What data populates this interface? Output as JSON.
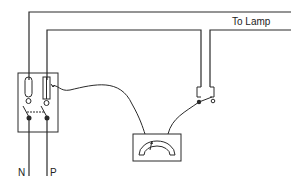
{
  "diagram": {
    "type": "wiring-circuit",
    "labels": {
      "to_lamp": "To  Lamp",
      "neutral": "N",
      "phase": "P"
    },
    "components": [
      {
        "id": "fuse-box",
        "description": "double-pole switch fuse unit with fuse and link"
      },
      {
        "id": "lamp-switch",
        "description": "single-pole switch on lamp circuit"
      },
      {
        "id": "meter",
        "description": "analog meter connected between fuse and switch"
      }
    ],
    "colors": {
      "line": "#2a2a2a",
      "background": "#ffffff"
    }
  }
}
